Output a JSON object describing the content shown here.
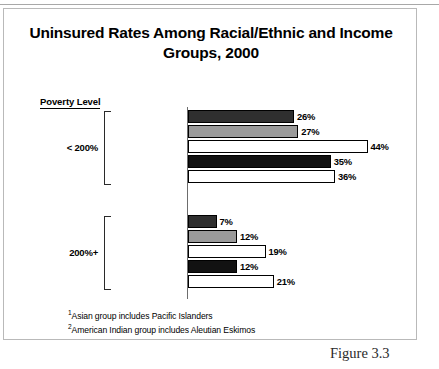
{
  "figure": {
    "caption": "Figure 3.3",
    "title": "Uninsured Rates Among Racial/Ethnic and Income Groups, 2000",
    "axis_header": "Poverty Level",
    "footnotes": [
      {
        "marker": "1",
        "text": "Asian group includes Pacific Islanders"
      },
      {
        "marker": "2",
        "text": "American Indian group includes Aleutian Eskimos"
      }
    ]
  },
  "chart_data": {
    "type": "bar",
    "orientation": "horizontal",
    "title": "Uninsured Rates Among Racial/Ethnic and Income Groups, 2000",
    "xlabel": "",
    "ylabel": "Poverty Level",
    "xlim": [
      0,
      50
    ],
    "grid": false,
    "legend": "none",
    "value_suffix": "%",
    "categories": [
      "White, Non-Hispanic",
      "Black, Non-Hispanic",
      "Hispanic",
      "Asian",
      "American Indian"
    ],
    "category_markers": [
      "",
      "",
      "",
      "1",
      "2"
    ],
    "groups": [
      {
        "name": "< 200%",
        "bars": [
          {
            "category": "White, Non-Hispanic",
            "marker": "",
            "value": 26,
            "label": "26%",
            "fill": "dark"
          },
          {
            "category": "Black, Non-Hispanic",
            "marker": "",
            "value": 27,
            "label": "27%",
            "fill": "gray"
          },
          {
            "category": "Hispanic",
            "marker": "",
            "value": 44,
            "label": "44%",
            "fill": "white"
          },
          {
            "category": "Asian",
            "marker": "1",
            "value": 35,
            "label": "35%",
            "fill": "black"
          },
          {
            "category": "American Indian",
            "marker": "2",
            "value": 36,
            "label": "36%",
            "fill": "white"
          }
        ]
      },
      {
        "name": "200%+",
        "bars": [
          {
            "category": "White, Non-Hispanic",
            "marker": "",
            "value": 7,
            "label": "7%",
            "fill": "dark"
          },
          {
            "category": "Black, Non-Hispanic",
            "marker": "",
            "value": 12,
            "label": "12%",
            "fill": "gray"
          },
          {
            "category": "Hispanic",
            "marker": "",
            "value": 19,
            "label": "19%",
            "fill": "white"
          },
          {
            "category": "Asian",
            "marker": "1",
            "value": 12,
            "label": "12%",
            "fill": "black"
          },
          {
            "category": "American Indian",
            "marker": "2",
            "value": 21,
            "label": "21%",
            "fill": "white"
          }
        ]
      }
    ],
    "colors": {
      "dark": "#2f2f2f",
      "gray": "#9a9a9a",
      "white": "#ffffff",
      "black": "#121212",
      "outline": "#000000",
      "axis": "#6d6d6d",
      "frame": "#b9b9b9"
    }
  }
}
